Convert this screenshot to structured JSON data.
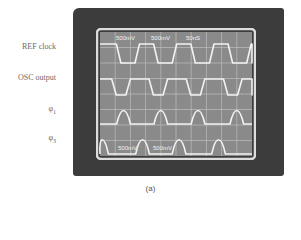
{
  "figure": {
    "caption": "(a)",
    "channel_labels": [
      {
        "text": "REF clock",
        "top": 42
      },
      {
        "text": "OSC output",
        "top": 73
      },
      {
        "text": "φ",
        "sub": "1",
        "top": 104
      },
      {
        "text": "φ",
        "sub": "3",
        "top": 133
      }
    ],
    "screen_readouts_top": [
      "500mV",
      "500mV",
      "50nS"
    ],
    "screen_readouts_bottom": [
      "500mV",
      "500mV"
    ],
    "grid": {
      "columns": 10,
      "rows": 8
    },
    "colors": {
      "bezel": "#3c3c3c",
      "screen": "#8a8a8a",
      "grid": "#bdbdbd",
      "trace": "#f2f2f2",
      "frame": "#dcdcdc"
    }
  },
  "chart_data": {
    "type": "line",
    "xlabel": "time (divisions)",
    "ylabel": "",
    "x_divisions": 10,
    "y_divisions": 8,
    "series": [
      {
        "name": "REF clock",
        "kind": "square",
        "period_div": 2.45,
        "duty": 0.5,
        "start_phase_div": 0.0,
        "high_y": 44,
        "low_y": 63
      },
      {
        "name": "OSC output",
        "kind": "square",
        "period_div": 2.45,
        "duty": 0.62,
        "start_phase_div": 0.6,
        "high_y": 79,
        "low_y": 95
      },
      {
        "name": "φ1",
        "kind": "pulse",
        "pulse_centers_div": [
          1.55,
          4.0,
          6.45,
          9.0
        ],
        "pulse_width_div": 0.45,
        "base_y": 124,
        "peak_y": 106
      },
      {
        "name": "φ3",
        "kind": "pulse",
        "pulse_centers_div": [
          0.1,
          2.8,
          5.2,
          7.8
        ],
        "pulse_width_div": 0.45,
        "base_y": 154,
        "peak_y": 135
      }
    ]
  }
}
